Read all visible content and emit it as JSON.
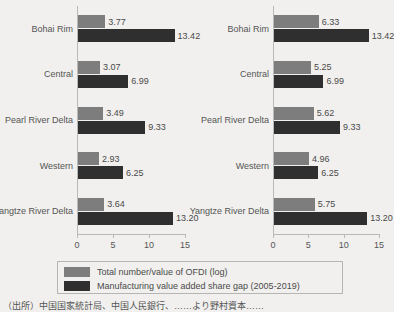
{
  "chart_data": {
    "type": "bar",
    "orientation": "horizontal",
    "title": "",
    "xlabel": "",
    "ylabel": "",
    "xlim": [
      0,
      15
    ],
    "xticks": [
      0,
      5,
      10,
      15
    ],
    "grid": false,
    "legend_position": "bottom",
    "categories": [
      "Bohai Rim",
      "Central",
      "Pearl River Delta",
      "Western",
      "Yangtze River Delta"
    ],
    "panels": [
      {
        "name": "left-panel",
        "series": [
          {
            "name": "Total number/value of OFDI (log)",
            "color": "#7d7d7d",
            "values": [
              3.77,
              3.07,
              3.49,
              2.93,
              3.64
            ]
          },
          {
            "name": "Manufacturing value added share gap (2005-2019)",
            "color": "#2f2f2f",
            "values": [
              13.42,
              6.99,
              9.33,
              6.25,
              13.2
            ]
          }
        ]
      },
      {
        "name": "right-panel",
        "series": [
          {
            "name": "Total number/value of OFDI (log)",
            "color": "#7d7d7d",
            "values": [
              6.33,
              5.25,
              5.62,
              4.96,
              5.75
            ]
          },
          {
            "name": "Manufacturing value added share gap (2005-2019)",
            "color": "#2f2f2f",
            "values": [
              13.42,
              6.99,
              9.33,
              6.25,
              13.2
            ]
          }
        ]
      }
    ],
    "legend": [
      {
        "label": "Total number/value of OFDI (log)",
        "color": "#7d7d7d"
      },
      {
        "label": "Manufacturing value added share gap (2005-2019)",
        "color": "#2f2f2f"
      }
    ]
  },
  "source_note": "（出所）中国国家統計局、中国人民銀行、……より野村資本……"
}
